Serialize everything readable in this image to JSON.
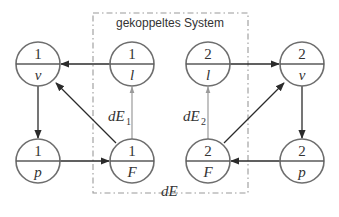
{
  "diagram": {
    "title": "gekoppeltes System",
    "coupling_label": {
      "main": "dE"
    },
    "nodes": [
      {
        "id": "1v",
        "top": "1",
        "bottom": "v",
        "cx": 38,
        "cy": 64
      },
      {
        "id": "1l",
        "top": "1",
        "bottom": "l",
        "cx": 132,
        "cy": 64
      },
      {
        "id": "2l",
        "top": "2",
        "bottom": "l",
        "cx": 208,
        "cy": 64
      },
      {
        "id": "2v",
        "top": "2",
        "bottom": "v",
        "cx": 302,
        "cy": 64
      },
      {
        "id": "1p",
        "top": "1",
        "bottom": "p",
        "cx": 38,
        "cy": 161
      },
      {
        "id": "1F",
        "top": "1",
        "bottom": "F",
        "cx": 132,
        "cy": 161
      },
      {
        "id": "2F",
        "top": "2",
        "bottom": "F",
        "cx": 208,
        "cy": 161
      },
      {
        "id": "2p",
        "top": "2",
        "bottom": "p",
        "cx": 302,
        "cy": 161
      }
    ],
    "edges": [
      {
        "from": "1l",
        "to": "1v",
        "style": "black"
      },
      {
        "from": "1v",
        "to": "1p",
        "style": "black"
      },
      {
        "from": "1p",
        "to": "1F",
        "style": "black"
      },
      {
        "from": "1F",
        "to": "1v",
        "style": "black"
      },
      {
        "from": "1F",
        "to": "1l",
        "style": "grey",
        "label": "dE",
        "sub": "1"
      },
      {
        "from": "2l",
        "to": "2v",
        "style": "black"
      },
      {
        "from": "2v",
        "to": "2p",
        "style": "black"
      },
      {
        "from": "2p",
        "to": "2F",
        "style": "black"
      },
      {
        "from": "2F",
        "to": "2v",
        "style": "black"
      },
      {
        "from": "2F",
        "to": "2l",
        "style": "grey",
        "label": "dE",
        "sub": "2"
      }
    ],
    "labels": {
      "dE1_main": "dE",
      "dE1_sub": "1",
      "dE2_main": "dE",
      "dE2_sub": "2",
      "dE_bottom": "dE"
    },
    "colors": {
      "node_stroke": "#6e6e6e",
      "edge": "#2b2b2b",
      "grey_edge": "#9a9a9a",
      "box": "#9a9a9a",
      "text": "#333333"
    }
  }
}
